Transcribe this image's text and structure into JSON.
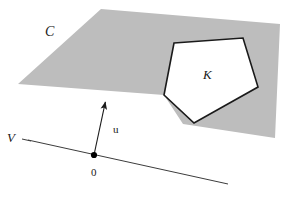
{
  "figure": {
    "background_color": "#ffffff",
    "width": 287,
    "height": 198,
    "labels": {
      "cone_label": "C",
      "body_label": "K",
      "vector_label": "u",
      "subspace_label": "V",
      "origin_label": "0"
    },
    "colors": {
      "shaded_fill": "#bdbdbd",
      "shaded_stroke": "none",
      "polygon_fill": "#ffffff",
      "polygon_stroke": "#1a1a1a",
      "line_stroke": "#3c3c3c",
      "arrow_stroke": "#1a1a1a",
      "point_fill": "#000000",
      "text_color": "#1a1a1a"
    },
    "shaded_plane": {
      "name": "shaded-parallelogram-C",
      "points": "101,9 280,24 275,138 183,124 164,95 18,84"
    },
    "polygon_K": {
      "name": "pentagon-K",
      "points": "174,43 243,38 258,87 194,123 164,95",
      "stroke_width": 1.6
    },
    "vector_u": {
      "name": "vector-arrow-u",
      "tail_x": 94,
      "tail_y": 155,
      "tip_x": 106,
      "tip_y": 99,
      "stroke_width": 1.1
    },
    "line_V": {
      "name": "subspace-line-V",
      "x1": 28,
      "y1": 140,
      "x2": 228,
      "y2": 184,
      "stroke_width": 1.0
    },
    "origin_point": {
      "name": "origin-dot",
      "cx": 94,
      "cy": 155,
      "r": 3.1
    },
    "label_positions": {
      "C": {
        "x": 45,
        "y": 36,
        "size": 14
      },
      "K": {
        "x": 203,
        "y": 79,
        "size": 13
      },
      "u": {
        "x": 113,
        "y": 133,
        "size": 11
      },
      "V": {
        "x": 13,
        "y": 142,
        "size": 13
      },
      "0": {
        "x": 91,
        "y": 176,
        "size": 11
      }
    }
  }
}
